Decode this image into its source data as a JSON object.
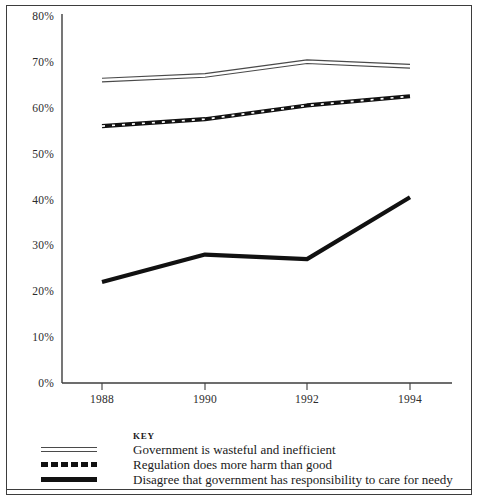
{
  "chart_data": {
    "type": "line",
    "title": "",
    "xlabel": "",
    "ylabel": "",
    "categories": [
      "1988",
      "1990",
      "1992",
      "1994"
    ],
    "x": [
      1988,
      1990,
      1992,
      1994
    ],
    "ylim": [
      0,
      80
    ],
    "yticks": [
      0,
      10,
      20,
      30,
      40,
      50,
      60,
      70,
      80
    ],
    "ytick_labels": [
      "0%",
      "10%",
      "20%",
      "30%",
      "40%",
      "50%",
      "60%",
      "70%",
      "80%"
    ],
    "grid": false,
    "legend_position": "bottom",
    "legend_title": "KEY",
    "series": [
      {
        "name": "Government is wasteful and inefficient",
        "style": "double-thin-line",
        "values": [
          66,
          67,
          70,
          69
        ]
      },
      {
        "name": "Regulation does more harm than good",
        "style": "dashed-thick-line",
        "values": [
          56,
          57.5,
          60.5,
          62.5
        ]
      },
      {
        "name": "Disagree that government has responsibility to care for needy",
        "style": "solid-thick-line",
        "values": [
          22,
          28,
          27,
          40.5
        ]
      }
    ]
  },
  "legend": {
    "title": "KEY",
    "items": [
      {
        "label": "Government is wasteful and inefficient",
        "swatch": "double-line-swatch"
      },
      {
        "label": "Regulation does more harm than good",
        "swatch": "dashed-line-swatch"
      },
      {
        "label": "Disagree that government has responsibility to care for needy",
        "swatch": "solid-line-swatch"
      }
    ]
  },
  "colors": {
    "axis": "#3d3d3d",
    "series_light": "#4a4a4a",
    "series_dark": "#111111",
    "text": "#1a1a1a",
    "background": "#ffffff"
  }
}
